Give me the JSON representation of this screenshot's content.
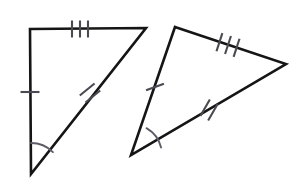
{
  "figure": {
    "background_color": "#ffffff",
    "stroke_color": "#151515",
    "tick_color": "#4a4a52",
    "arc_color": "#5d5d68",
    "width": 301,
    "height": 192
  },
  "shapes": [
    {
      "name": "left-triangle",
      "label": "Left triangle",
      "stroke_width": 2.6,
      "points": "30,29 146,28 31,174",
      "vertices": [
        {
          "name": "top-left-vertex",
          "x": 30,
          "y": 29
        },
        {
          "name": "top-right-vertex",
          "x": 146,
          "y": 28
        },
        {
          "name": "bottom-vertex",
          "x": 31,
          "y": 174
        }
      ],
      "edges": [
        {
          "name": "top-edge",
          "from": "top-left-vertex",
          "to": "top-right-vertex",
          "ticks": 3
        },
        {
          "name": "hypotenuse-edge",
          "from": "top-right-vertex",
          "to": "bottom-vertex",
          "ticks": 2
        },
        {
          "name": "left-edge",
          "from": "bottom-vertex",
          "to": "top-left-vertex",
          "ticks": 1
        }
      ],
      "tick_groups": [
        {
          "name": "tick-group-top-edge-three",
          "count": 3,
          "center_x": 80,
          "center_y": 29,
          "angle_deg": 0,
          "length": 17,
          "spacing": 8,
          "stroke_width": 2.1
        },
        {
          "name": "tick-group-hypotenuse-two",
          "count": 2,
          "center_x": 90,
          "center_y": 93,
          "angle_deg": 51,
          "length": 19,
          "spacing": 9,
          "stroke_width": 2.1
        },
        {
          "name": "tick-group-left-edge-one",
          "count": 1,
          "center_x": 30,
          "center_y": 92,
          "angle_deg": 90,
          "length": 19,
          "spacing": 0,
          "stroke_width": 2.1
        }
      ],
      "angle_marks": [
        {
          "name": "angle-arc-bottom-vertex",
          "vertex_x": 31,
          "vertex_y": 174,
          "radius": 31,
          "start_deg": -90,
          "end_deg": -45,
          "stroke_width": 1.9
        }
      ]
    },
    {
      "name": "right-triangle",
      "label": "Right triangle",
      "stroke_width": 2.6,
      "points": "175,27 286,64 131,155",
      "vertices": [
        {
          "name": "top-vertex",
          "x": 175,
          "y": 27
        },
        {
          "name": "right-vertex",
          "x": 286,
          "y": 64
        },
        {
          "name": "bottom-left-vertex",
          "x": 131,
          "y": 155
        }
      ],
      "edges": [
        {
          "name": "top-right-edge",
          "from": "top-vertex",
          "to": "right-vertex",
          "ticks": 3
        },
        {
          "name": "bottom-right-edge",
          "from": "right-vertex",
          "to": "bottom-left-vertex",
          "ticks": 2
        },
        {
          "name": "left-edge",
          "from": "bottom-left-vertex",
          "to": "top-vertex",
          "ticks": 1
        }
      ],
      "tick_groups": [
        {
          "name": "tick-group-top-right-edge-three",
          "count": 3,
          "center_x": 228,
          "center_y": 45,
          "angle_deg": 18,
          "length": 19,
          "spacing": 9,
          "stroke_width": 2.1
        },
        {
          "name": "tick-group-bottom-right-edge-two",
          "count": 2,
          "center_x": 209,
          "center_y": 110,
          "angle_deg": 30,
          "length": 19,
          "spacing": 9,
          "stroke_width": 2.1
        },
        {
          "name": "tick-group-left-edge-one",
          "count": 1,
          "center_x": 155,
          "center_y": 87,
          "angle_deg": 70,
          "length": 19,
          "spacing": 0,
          "stroke_width": 2.1
        }
      ],
      "angle_marks": [
        {
          "name": "angle-arc-bottom-left-vertex",
          "vertex_x": 131,
          "vertex_y": 155,
          "radius": 31,
          "start_deg": -60,
          "end_deg": -14,
          "stroke_width": 1.9
        }
      ]
    }
  ]
}
